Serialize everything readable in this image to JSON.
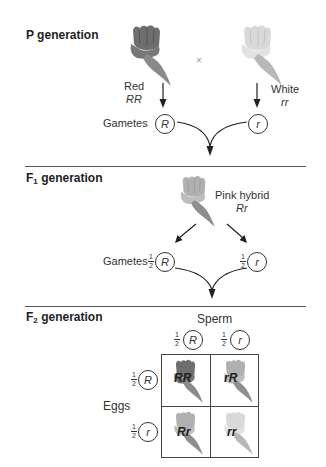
{
  "sections": {
    "p": {
      "label": "P generation",
      "parent1": {
        "phenotype": "Red",
        "genotype": "RR",
        "shade": "#6e6e6e"
      },
      "parent2": {
        "phenotype": "White",
        "genotype": "rr",
        "shade": "#d9d9d9"
      },
      "cross_symbol": "×",
      "gametes_label": "Gametes",
      "gametes": [
        "R",
        "r"
      ]
    },
    "f1": {
      "label_main": "F",
      "label_sub": "1",
      "label_rest": " generation",
      "offspring": {
        "phenotype": "Pink hybrid",
        "genotype": "Rr",
        "shade": "#a8a8a8"
      },
      "gametes_label": "Gametes",
      "gametes": [
        {
          "fraction_num": "1",
          "fraction_den": "2",
          "allele": "R"
        },
        {
          "fraction_num": "1",
          "fraction_den": "2",
          "allele": "r"
        }
      ]
    },
    "f2": {
      "label_main": "F",
      "label_sub": "2",
      "label_rest": " generation",
      "sperm_label": "Sperm",
      "eggs_label": "Eggs",
      "sperm": [
        {
          "fraction_num": "1",
          "fraction_den": "2",
          "allele": "R"
        },
        {
          "fraction_num": "1",
          "fraction_den": "2",
          "allele": "r"
        }
      ],
      "eggs": [
        {
          "fraction_num": "1",
          "fraction_den": "2",
          "allele": "R"
        },
        {
          "fraction_num": "1",
          "fraction_den": "2",
          "allele": "r"
        }
      ],
      "punnett": [
        [
          {
            "genotype": "RR",
            "shade": "#6e6e6e"
          },
          {
            "genotype": "rR",
            "shade": "#a8a8a8"
          }
        ],
        [
          {
            "genotype": "Rr",
            "shade": "#a8a8a8"
          },
          {
            "genotype": "rr",
            "shade": "#d9d9d9"
          }
        ]
      ]
    }
  }
}
